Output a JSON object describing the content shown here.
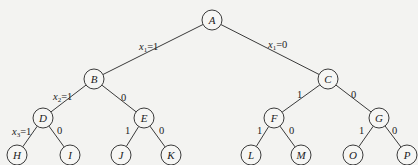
{
  "diagram": {
    "type": "binary-decision-tree",
    "nodes": [
      {
        "id": "A",
        "x": 212,
        "y": 20
      },
      {
        "id": "B",
        "x": 94,
        "y": 79
      },
      {
        "id": "C",
        "x": 328,
        "y": 79
      },
      {
        "id": "D",
        "x": 43,
        "y": 118
      },
      {
        "id": "E",
        "x": 144,
        "y": 118
      },
      {
        "id": "F",
        "x": 274,
        "y": 118
      },
      {
        "id": "G",
        "x": 379,
        "y": 118
      },
      {
        "id": "H",
        "x": 17,
        "y": 155
      },
      {
        "id": "I",
        "x": 70,
        "y": 155
      },
      {
        "id": "J",
        "x": 121,
        "y": 155
      },
      {
        "id": "K",
        "x": 171,
        "y": 155
      },
      {
        "id": "L",
        "x": 251,
        "y": 155
      },
      {
        "id": "M",
        "x": 301,
        "y": 155
      },
      {
        "id": "O",
        "x": 353,
        "y": 155
      },
      {
        "id": "P",
        "x": 407,
        "y": 155
      }
    ],
    "edges": [
      {
        "from": "A",
        "to": "B",
        "label": "x1=1",
        "var": "x",
        "sub": "1",
        "val": "=1",
        "lx": 139,
        "ly": 50
      },
      {
        "from": "A",
        "to": "C",
        "label": "x1=0",
        "var": "x",
        "sub": "1",
        "val": "=0",
        "lx": 268,
        "ly": 48
      },
      {
        "from": "B",
        "to": "D",
        "label": "x2=1",
        "var": "x",
        "sub": "2",
        "val": "=1",
        "lx": 53,
        "ly": 100
      },
      {
        "from": "B",
        "to": "E",
        "label": "0",
        "lx": 121,
        "ly": 101
      },
      {
        "from": "D",
        "to": "H",
        "label": "x3=1",
        "var": "x",
        "sub": "3",
        "val": "=1",
        "lx": 12,
        "ly": 135
      },
      {
        "from": "D",
        "to": "I",
        "label": "0",
        "lx": 57,
        "ly": 134
      },
      {
        "from": "E",
        "to": "J",
        "label": "1",
        "lx": 125,
        "ly": 134
      },
      {
        "from": "E",
        "to": "K",
        "label": "0",
        "lx": 159,
        "ly": 134
      },
      {
        "from": "C",
        "to": "F",
        "label": "1",
        "lx": 297,
        "ly": 98
      },
      {
        "from": "C",
        "to": "G",
        "label": "0",
        "lx": 351,
        "ly": 98
      },
      {
        "from": "F",
        "to": "L",
        "label": "1",
        "lx": 257,
        "ly": 134
      },
      {
        "from": "F",
        "to": "M",
        "label": "0",
        "lx": 289,
        "ly": 134
      },
      {
        "from": "G",
        "to": "O",
        "label": "1",
        "lx": 359,
        "ly": 134
      },
      {
        "from": "G",
        "to": "P",
        "label": "0",
        "lx": 392,
        "ly": 134
      }
    ],
    "node_radius": 10
  }
}
